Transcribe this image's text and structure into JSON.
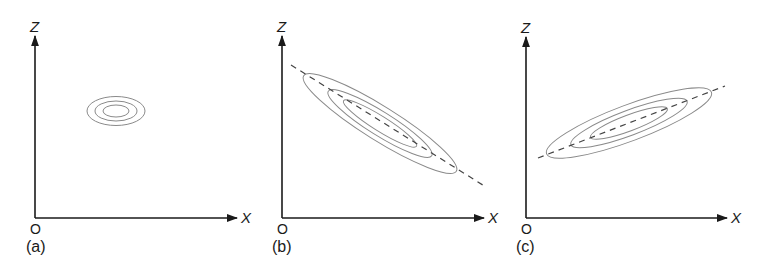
{
  "figure": {
    "panels": [
      {
        "id": "a",
        "caption": "(a)",
        "origin_label": "O",
        "x_label": "X",
        "z_label": "Z",
        "correlation": "none",
        "contours": 3,
        "dashed_axis": false
      },
      {
        "id": "b",
        "caption": "(b)",
        "origin_label": "O",
        "x_label": "X",
        "z_label": "Z",
        "correlation": "negative",
        "contours": 3,
        "dashed_axis": true
      },
      {
        "id": "c",
        "caption": "(c)",
        "origin_label": "O",
        "x_label": "X",
        "z_label": "Z",
        "correlation": "positive",
        "contours": 3,
        "dashed_axis": true
      }
    ]
  }
}
